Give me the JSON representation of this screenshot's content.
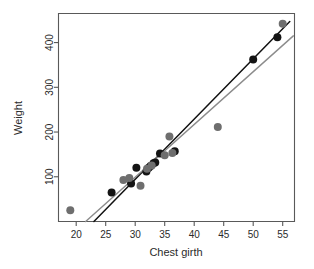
{
  "chart_data": {
    "type": "scatter",
    "title": "",
    "xlabel": "Chest girth",
    "ylabel": "Weight",
    "xlim": [
      17.0,
      57.0
    ],
    "ylim": [
      0.0,
      465.0
    ],
    "xticks": [
      20,
      25,
      30,
      35,
      40,
      45,
      50,
      55
    ],
    "yticks": [
      100,
      200,
      300,
      400
    ],
    "xtick_labels": [
      "20",
      "25",
      "30",
      "35",
      "40",
      "45",
      "50",
      "55"
    ],
    "ytick_labels": [
      "100",
      "200",
      "300",
      "400"
    ],
    "grid": false,
    "legend": "none",
    "series": [
      {
        "name": "observations-dark",
        "marker": "filled-circle",
        "color": "#141414",
        "points": [
          {
            "x": 26.0,
            "y": 65
          },
          {
            "x": 29.3,
            "y": 85
          },
          {
            "x": 30.2,
            "y": 120
          },
          {
            "x": 31.9,
            "y": 112
          },
          {
            "x": 32.3,
            "y": 120
          },
          {
            "x": 32.6,
            "y": 124
          },
          {
            "x": 33.1,
            "y": 130
          },
          {
            "x": 33.4,
            "y": 132
          },
          {
            "x": 34.2,
            "y": 152
          },
          {
            "x": 36.7,
            "y": 157
          },
          {
            "x": 50.0,
            "y": 362
          },
          {
            "x": 54.1,
            "y": 412
          }
        ]
      },
      {
        "name": "observations-gray",
        "marker": "filled-circle",
        "color": "#6e6e6e",
        "points": [
          {
            "x": 19.0,
            "y": 25
          },
          {
            "x": 28.0,
            "y": 93
          },
          {
            "x": 29.0,
            "y": 97
          },
          {
            "x": 30.9,
            "y": 80
          },
          {
            "x": 32.0,
            "y": 118
          },
          {
            "x": 32.8,
            "y": 125
          },
          {
            "x": 35.0,
            "y": 148
          },
          {
            "x": 35.8,
            "y": 190
          },
          {
            "x": 36.3,
            "y": 153
          },
          {
            "x": 44.0,
            "y": 211
          },
          {
            "x": 55.0,
            "y": 442
          }
        ]
      }
    ],
    "fit_lines": [
      {
        "name": "primary-fit",
        "color": "#111111",
        "style": "solid",
        "x_start": 23.0,
        "y_start": 0,
        "x_end": 56.2,
        "y_end": 447
      },
      {
        "name": "secondary-fit",
        "color": "#8c8c8c",
        "style": "solid",
        "x_start": 21.6,
        "y_start": 0,
        "x_end": 56.8,
        "y_end": 415
      }
    ]
  },
  "axes": {
    "x_title": "Chest girth",
    "y_title": "Weight"
  }
}
